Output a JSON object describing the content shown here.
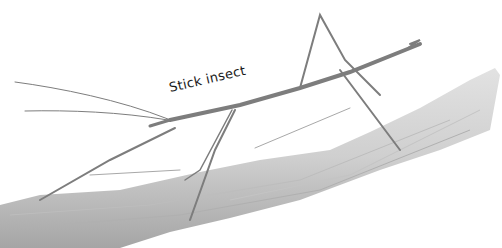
{
  "illustration": {
    "subject": "stick insect on branch",
    "label": "Stick insect",
    "colors": {
      "background": "#ffffff",
      "branch_light": "#d8d8d8",
      "branch_dark": "#9a9a9a",
      "insect": "#8a8a8a",
      "label_text": "#1a1a1a"
    }
  }
}
